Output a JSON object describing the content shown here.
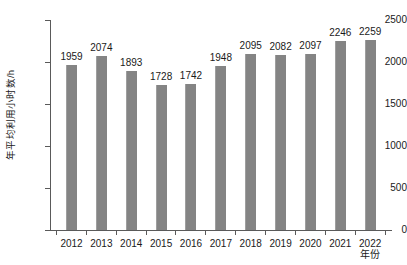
{
  "chart_data": {
    "type": "bar",
    "title": "",
    "subtitle": "",
    "xlabel": "年份",
    "ylabel": "年平均利用小时数/h",
    "categories": [
      "2012",
      "2013",
      "2014",
      "2015",
      "2016",
      "2017",
      "2018",
      "2019",
      "2020",
      "2021",
      "2022"
    ],
    "values": [
      1959,
      2074,
      1893,
      1728,
      1742,
      1948,
      2095,
      2082,
      2097,
      2246,
      2259
    ],
    "data_labels": [
      "1959",
      "2074",
      "1893",
      "1728",
      "1742",
      "1948",
      "2095",
      "2082",
      "2097",
      "2246",
      "2259"
    ],
    "ylim": [
      0,
      2500
    ],
    "ytick_labels": [
      "0",
      "500",
      "1000",
      "1500",
      "2000",
      "2500"
    ],
    "ytick_values": [
      0,
      500,
      1000,
      1500,
      2000,
      2500
    ],
    "grid": false,
    "legend": false,
    "legend_position": "none",
    "bar_color": "#848484",
    "axis_color": "#5a5a5a",
    "text_color": "#1a1a1a",
    "background_color": "#ffffff"
  }
}
